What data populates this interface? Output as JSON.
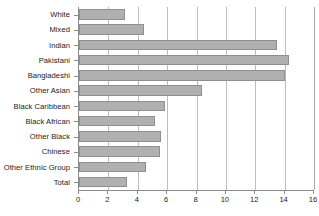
{
  "chart_data": {
    "type": "bar",
    "orientation": "horizontal",
    "title": "",
    "subtitle": "",
    "xlabel": "",
    "ylabel": "",
    "xlim": [
      0,
      16
    ],
    "xticks": [
      0,
      2,
      4,
      6,
      8,
      10,
      12,
      14,
      16
    ],
    "xtick_labels": [
      "0",
      "2",
      "4",
      "6",
      "8",
      "10",
      "12",
      "14",
      "16"
    ],
    "grid": true,
    "legend": null,
    "categories": [
      "White",
      "Mixed",
      "Indian",
      "Pakistani",
      "Bangladeshi",
      "Other Asian",
      "Black Caribbean",
      "Black African",
      "Other Black",
      "Chinese",
      "Other Ethnic Group",
      "Total"
    ],
    "values": [
      3.1,
      4.4,
      13.5,
      14.3,
      14.0,
      8.4,
      5.85,
      5.2,
      5.6,
      5.5,
      4.55,
      3.3
    ],
    "bar_color": "#b0b0b0",
    "bar_edge_color": "#8f8f8f",
    "grid_color": "#bdbdbd",
    "axis_color": "#8c8c8c",
    "text_color": "#1a1a1a",
    "background": "#ffffff"
  }
}
